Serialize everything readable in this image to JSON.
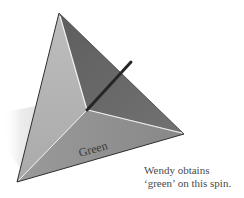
{
  "figure": {
    "object": "tetrahedral spinner",
    "face_label": "Green",
    "colors": {
      "left_face": "#b3b3b3",
      "right_face": "#6b6b6b",
      "bottom_face": "#909090",
      "ridge_highlight": "#f2f2f2",
      "outline": "#2e2e2e",
      "stick": "#262626",
      "shadow": "#ececec"
    }
  },
  "caption": {
    "line1": "Wendy obtains",
    "line2": "‘green’ on this spin."
  }
}
